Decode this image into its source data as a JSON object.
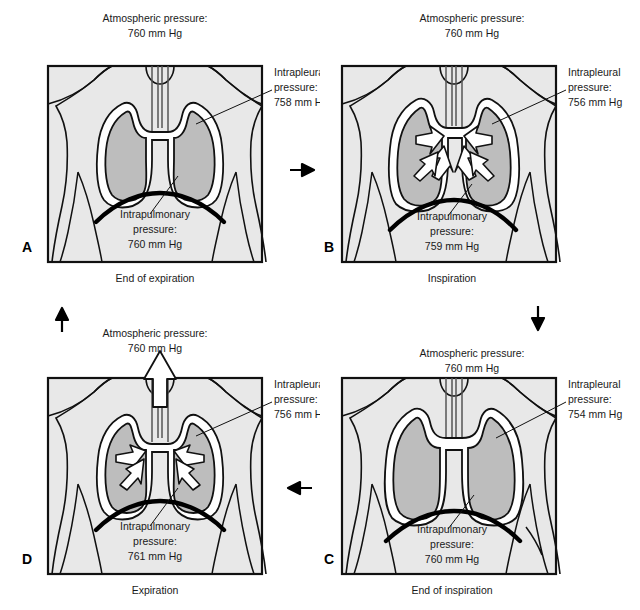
{
  "figure": {
    "colors": {
      "body_fill": "#e2e2e2",
      "lung_fill": "#bdbdbd",
      "pleura_fill": "#ffffff",
      "outline": "#111111",
      "diaphragm": "#000000",
      "frame": "#111111",
      "background": "#ffffff"
    }
  },
  "panels": [
    {
      "id": "A",
      "letter": "A",
      "caption": "End of expiration",
      "atmospheric": {
        "label": "Atmospheric pressure:",
        "value": "760 mm Hg"
      },
      "intrapleural": {
        "label_line1": "Intrapleural",
        "label_line2": "pressure:",
        "value": "758 mm Hg"
      },
      "intrapulmonary": {
        "label_line1": "Intrapulmonary",
        "label_line2": "pressure:",
        "value": "760 mm Hg"
      },
      "airflow": "none"
    },
    {
      "id": "B",
      "letter": "B",
      "caption": "Inspiration",
      "atmospheric": {
        "label": "Atmospheric pressure:",
        "value": "760 mm Hg"
      },
      "intrapleural": {
        "label_line1": "Intrapleural",
        "label_line2": "pressure:",
        "value": "756 mm Hg"
      },
      "intrapulmonary": {
        "label_line1": "Intrapulmonary",
        "label_line2": "pressure:",
        "value": "759 mm Hg"
      },
      "airflow": "inward"
    },
    {
      "id": "C",
      "letter": "C",
      "caption": "End of inspiration",
      "atmospheric": {
        "label": "Atmospheric pressure:",
        "value": "760 mm Hg"
      },
      "intrapleural": {
        "label_line1": "Intrapleural",
        "label_line2": "pressure:",
        "value": "754 mm Hg"
      },
      "intrapulmonary": {
        "label_line1": "Intrapulmonary",
        "label_line2": "pressure:",
        "value": "760 mm Hg"
      },
      "airflow": "none"
    },
    {
      "id": "D",
      "letter": "D",
      "caption": "Expiration",
      "atmospheric": {
        "label": "Atmospheric pressure:",
        "value": "760 mm Hg"
      },
      "intrapleural": {
        "label_line1": "Intrapleural",
        "label_line2": "pressure:",
        "value": "756 mm Hg"
      },
      "intrapulmonary": {
        "label_line1": "Intrapulmonary",
        "label_line2": "pressure:",
        "value": "761 mm Hg"
      },
      "airflow": "outward"
    }
  ],
  "cycle_arrows": [
    {
      "name": "arrow-a-to-b",
      "direction": "right"
    },
    {
      "name": "arrow-b-to-c",
      "direction": "down"
    },
    {
      "name": "arrow-c-to-d",
      "direction": "left"
    },
    {
      "name": "arrow-d-to-a",
      "direction": "up"
    }
  ]
}
